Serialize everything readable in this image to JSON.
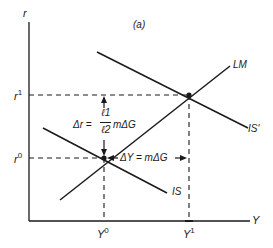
{
  "diagram": {
    "panel_label": "(a)",
    "axes": {
      "y_label": "r",
      "x_label": "Y"
    },
    "levels": {
      "r0": {
        "base": "r",
        "sup": "0"
      },
      "r1": {
        "base": "r",
        "sup": "1"
      },
      "Y0": {
        "base": "Y",
        "sup": "0"
      },
      "Y1": {
        "base": "Y",
        "sup": "1"
      }
    },
    "curves": {
      "LM": "LM",
      "IS": "IS",
      "IS_prime": "IS'"
    },
    "annotations": {
      "delta_r_lhs": "Δr =",
      "frac_num": "ℓ1",
      "frac_den": "ℓ2",
      "delta_r_rhs": "mΔG",
      "delta_Y": "ΔY = mΔG"
    },
    "colors": {
      "ink": "#1a1a1a",
      "background": "#ffffff"
    }
  }
}
